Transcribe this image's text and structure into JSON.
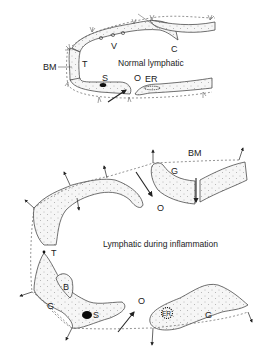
{
  "figure": {
    "top_panel": {
      "caption": "Normal lymphatic",
      "labels": {
        "bm": "BM",
        "t": "T",
        "v": "V",
        "c": "C",
        "s": "S",
        "o": "O",
        "er": "ER"
      }
    },
    "bottom_panel": {
      "caption": "Lymphatic during inflammation",
      "labels": {
        "bm": "BM",
        "g_top": "G",
        "o_top": "O",
        "t": "T",
        "b": "B",
        "g_left": "G",
        "s": "S",
        "o_bottom": "O",
        "er": "ER",
        "g_right": "G"
      }
    }
  }
}
